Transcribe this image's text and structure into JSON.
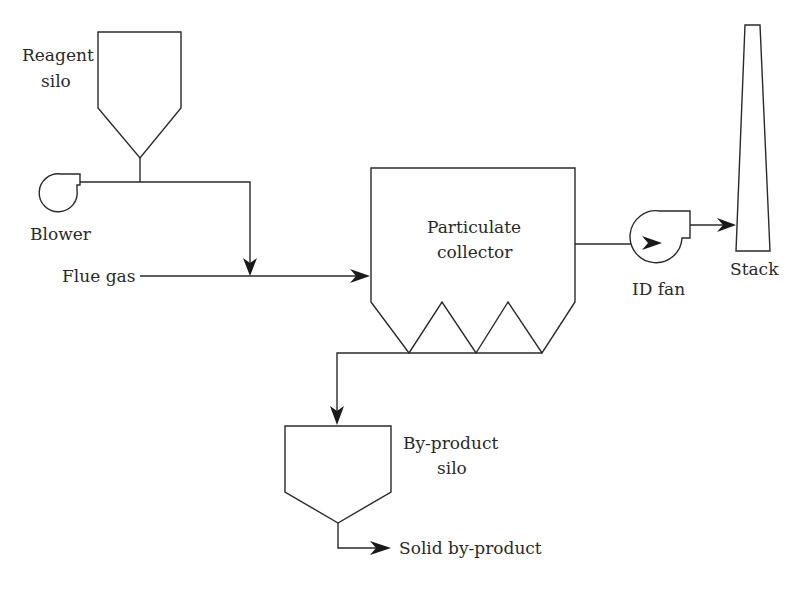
{
  "diagram": {
    "type": "process-flow",
    "colors": {
      "line": "#2a2a2a",
      "arrow": "#1a1a1a",
      "background": "#ffffff"
    },
    "labels": {
      "reagent_silo_line1": "Reagent",
      "reagent_silo_line2": "silo",
      "blower": "Blower",
      "flue_gas": "Flue gas",
      "collector_line1": "Particulate",
      "collector_line2": "collector",
      "id_fan": "ID fan",
      "stack": "Stack",
      "byproduct_silo_line1": "By-product",
      "byproduct_silo_line2": "silo",
      "solid_byproduct": "Solid by-product"
    },
    "nodes": [
      {
        "id": "reagent-silo",
        "label": "Reagent silo"
      },
      {
        "id": "blower",
        "label": "Blower"
      },
      {
        "id": "particulate-collector",
        "label": "Particulate collector"
      },
      {
        "id": "id-fan",
        "label": "ID fan"
      },
      {
        "id": "stack",
        "label": "Stack"
      },
      {
        "id": "byproduct-silo",
        "label": "By-product silo"
      }
    ],
    "edges": [
      {
        "from": "reagent-silo",
        "to": "flue-gas-line"
      },
      {
        "from": "blower",
        "to": "flue-gas-line"
      },
      {
        "from": "flue-gas",
        "to": "particulate-collector"
      },
      {
        "from": "particulate-collector",
        "to": "id-fan"
      },
      {
        "from": "id-fan",
        "to": "stack"
      },
      {
        "from": "particulate-collector",
        "to": "byproduct-silo"
      },
      {
        "from": "byproduct-silo",
        "to": "solid-byproduct"
      }
    ]
  }
}
